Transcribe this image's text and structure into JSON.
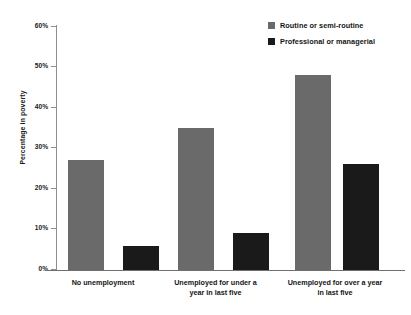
{
  "chart_data": {
    "type": "bar",
    "title": "",
    "subtitle": "",
    "xlabel": "",
    "ylabel": "Percentage in poverty",
    "ylim": [
      0,
      60
    ],
    "ytick_labels": [
      "60%",
      "50%",
      "40%",
      "30%",
      "20%",
      "10%",
      "0%"
    ],
    "ytick_values": [
      60,
      50,
      40,
      30,
      20,
      10,
      0
    ],
    "grid": false,
    "legend_position": "top-right",
    "categories": [
      "No unemployment",
      "Unemployed for under a year in last five",
      "Unemployed for over a year in last five"
    ],
    "category_lines": [
      [
        "No unemployment"
      ],
      [
        "Unemployed for under a",
        "year in last five"
      ],
      [
        "Unemployed for over a year",
        "in last five"
      ]
    ],
    "series": [
      {
        "name": "Routine or semi-routine",
        "color": "#6a6a6a",
        "values": [
          27,
          35,
          48
        ]
      },
      {
        "name": "Professional or managerial",
        "color": "#1a1a1a",
        "values": [
          6,
          9,
          26
        ]
      }
    ]
  },
  "legend": {
    "entries": [
      {
        "label": "Routine or semi-routine",
        "color": "#6a6a6a"
      },
      {
        "label": "Professional or managerial",
        "color": "#1a1a1a"
      }
    ]
  },
  "axis": {
    "y_title": "Percentage in poverty",
    "y_ticks": [
      "60%",
      "50%",
      "40%",
      "30%",
      "20%",
      "10%",
      "0%"
    ]
  },
  "colors": {
    "series_routine": "#6a6a6a",
    "series_professional": "#1a1a1a",
    "axis": "#8e8e8e",
    "text": "#141414",
    "background": "#ffffff"
  }
}
